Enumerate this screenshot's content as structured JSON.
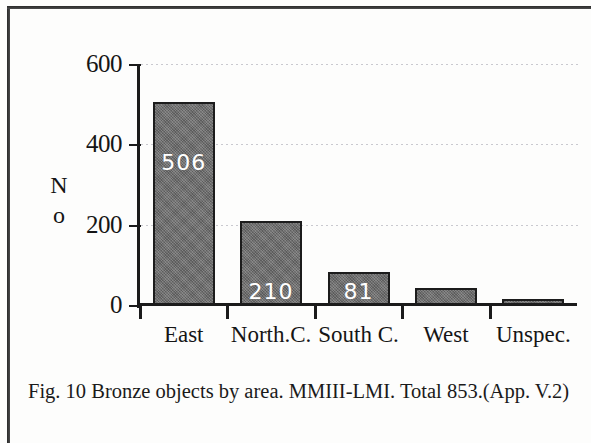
{
  "figure": {
    "caption": "Fig. 10  Bronze objects by area. MMIII-LMI. Total 853.(App. V.2)"
  },
  "chart_data": {
    "type": "bar",
    "title": "",
    "subtitle": "",
    "xlabel": "",
    "ylabel": "No",
    "categories": [
      "East",
      "North.C.",
      "South C.",
      "West",
      "Unspec."
    ],
    "values": [
      506,
      210,
      81,
      42,
      14
    ],
    "data_labels": [
      "506",
      "210",
      "81",
      "",
      ""
    ],
    "ylim": [
      0,
      600
    ],
    "yticks": [
      0,
      200,
      400,
      600
    ],
    "ytick_labels": [
      "0",
      "200",
      "400",
      "600"
    ],
    "grid": true,
    "grid_axis": "y",
    "legend": false,
    "bar_color": "#6f6f6f",
    "bar_edge_color": "#1c1c1c",
    "label_color": "#ffffff",
    "axis_color": "#1b1b1b",
    "total": 853
  }
}
